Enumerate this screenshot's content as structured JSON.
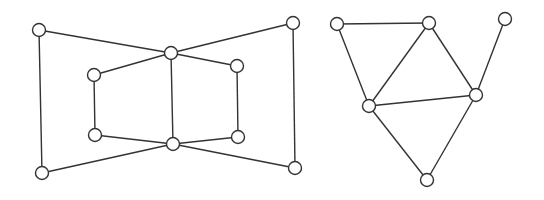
{
  "diagram": {
    "style": {
      "background": "#ffffff",
      "stroke": "#333333",
      "node_fill": "#ffffff",
      "node_radius": 6.5
    },
    "graphs": [
      {
        "name": "left-graph",
        "nodes": [
          {
            "id": "L1",
            "x": 39,
            "y": 30
          },
          {
            "id": "L2",
            "x": 293,
            "y": 23
          },
          {
            "id": "L3",
            "x": 171,
            "y": 53
          },
          {
            "id": "L4",
            "x": 94,
            "y": 75
          },
          {
            "id": "L5",
            "x": 237,
            "y": 66
          },
          {
            "id": "L6",
            "x": 95,
            "y": 135
          },
          {
            "id": "L7",
            "x": 238,
            "y": 137
          },
          {
            "id": "L8",
            "x": 173,
            "y": 144
          },
          {
            "id": "L9",
            "x": 42,
            "y": 173
          },
          {
            "id": "L10",
            "x": 295,
            "y": 168
          }
        ],
        "edges": [
          [
            "L1",
            "L3"
          ],
          [
            "L2",
            "L3"
          ],
          [
            "L1",
            "L9"
          ],
          [
            "L2",
            "L10"
          ],
          [
            "L3",
            "L4"
          ],
          [
            "L3",
            "L5"
          ],
          [
            "L3",
            "L8"
          ],
          [
            "L4",
            "L6"
          ],
          [
            "L5",
            "L7"
          ],
          [
            "L6",
            "L8"
          ],
          [
            "L7",
            "L8"
          ],
          [
            "L9",
            "L8"
          ],
          [
            "L10",
            "L8"
          ]
        ]
      },
      {
        "name": "right-graph",
        "nodes": [
          {
            "id": "R1",
            "x": 337,
            "y": 24
          },
          {
            "id": "R2",
            "x": 429,
            "y": 23
          },
          {
            "id": "R3",
            "x": 505,
            "y": 19
          },
          {
            "id": "R4",
            "x": 369,
            "y": 106
          },
          {
            "id": "R5",
            "x": 476,
            "y": 95
          },
          {
            "id": "R6",
            "x": 427,
            "y": 180
          }
        ],
        "edges": [
          [
            "R1",
            "R2"
          ],
          [
            "R1",
            "R4"
          ],
          [
            "R2",
            "R4"
          ],
          [
            "R2",
            "R5"
          ],
          [
            "R3",
            "R5"
          ],
          [
            "R4",
            "R5"
          ],
          [
            "R4",
            "R6"
          ],
          [
            "R5",
            "R6"
          ]
        ]
      }
    ]
  }
}
